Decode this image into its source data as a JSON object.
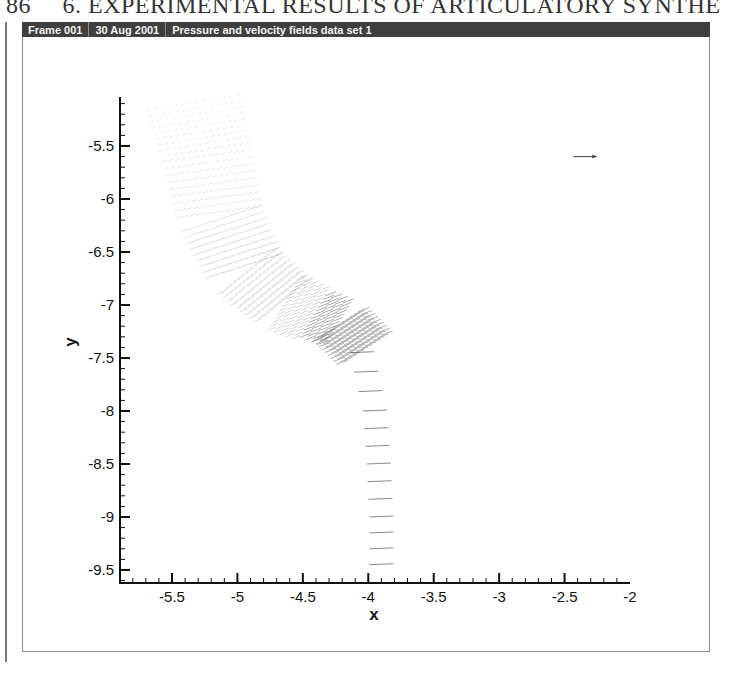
{
  "page": {
    "page_number": "86",
    "running_head": "6. EXPERIMENTAL RESULTS OF ARTICULATORY SYNTHE"
  },
  "frame_header": {
    "frame": "Frame 001",
    "date": "30 Aug 2001",
    "title": "Pressure and velocity fields data set 1"
  },
  "colors": {
    "header_bg": "#3f3f3f",
    "header_text": "#f2f2f2",
    "axis": "#111111",
    "vectors": "#555555"
  },
  "chart_data": {
    "type": "vector_field",
    "title": "Pressure and velocity fields data set 1",
    "xlabel": "x",
    "ylabel": "y",
    "xlim": [
      -5.9,
      -2.0
    ],
    "ylim": [
      -9.6,
      -5.1
    ],
    "x_ticks": [
      "-5.5",
      "-5",
      "-4.5",
      "-4",
      "-3.5",
      "-3",
      "-2.5",
      "-2"
    ],
    "y_ticks": [
      "-5.5",
      "-6",
      "-6.5",
      "-7",
      "-7.5",
      "-8",
      "-8.5",
      "-9",
      "-9.5"
    ],
    "grid": false,
    "legend": "none",
    "reference_vector": {
      "x": -2.25,
      "y": -5.6,
      "direction": "right"
    },
    "channel_centerline": [
      {
        "x": -5.35,
        "y": -5.1
      },
      {
        "x": -5.25,
        "y": -5.6
      },
      {
        "x": -5.15,
        "y": -6.2
      },
      {
        "x": -4.95,
        "y": -6.7
      },
      {
        "x": -4.65,
        "y": -7.0
      },
      {
        "x": -4.25,
        "y": -7.2
      },
      {
        "x": -4.05,
        "y": -7.45
      },
      {
        "x": -3.95,
        "y": -8.0
      },
      {
        "x": -3.92,
        "y": -8.5
      },
      {
        "x": -3.9,
        "y": -9.0
      },
      {
        "x": -3.9,
        "y": -9.45
      }
    ]
  }
}
